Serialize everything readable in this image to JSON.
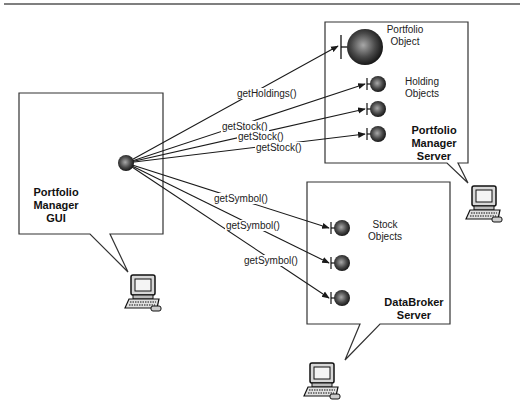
{
  "nodes": {
    "gui": {
      "label_line1": "Portfolio",
      "label_line2": "Manager",
      "label_line3": "GUI"
    },
    "portfolio_server": {
      "label_line1": "Portfolio",
      "label_line2": "Manager",
      "label_line3": "Server"
    },
    "databroker_server": {
      "label_line1": "DataBroker",
      "label_line2": "Server"
    },
    "portfolio_object": {
      "label_line1": "Portfolio",
      "label_line2": "Object"
    },
    "holding_objects": {
      "label_line1": "Holding",
      "label_line2": "Objects"
    },
    "stock_objects": {
      "label_line1": "Stock",
      "label_line2": "Objects"
    }
  },
  "calls": {
    "get_holdings": "getHoldings()",
    "get_stock_1": "getStock()",
    "get_stock_2": "getStock()",
    "get_stock_3": "getStock()",
    "get_symbol_1": "getSymbol()",
    "get_symbol_2": "getSymbol()",
    "get_symbol_3": "getSymbol()"
  },
  "icons": {
    "computer": "computer-workstation-icon",
    "object": "sphere-object-icon"
  },
  "colors": {
    "line": "#1a1a1a",
    "box_border": "#333333",
    "sphere_dark": "#111111",
    "sphere_light": "#9a9a9a"
  }
}
